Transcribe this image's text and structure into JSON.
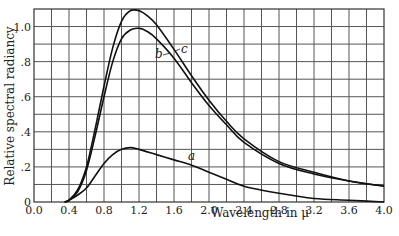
{
  "chart_data": {
    "type": "line",
    "title": "",
    "xlabel": "Wavelength in μ",
    "ylabel": "Relative spectral radiancy",
    "xlim": [
      0.0,
      4.0
    ],
    "ylim": [
      0.0,
      1.1
    ],
    "grid": true,
    "x_ticks": [
      0.0,
      0.4,
      0.8,
      1.2,
      1.6,
      2.0,
      2.4,
      2.8,
      3.2,
      3.6,
      4.0
    ],
    "x_tick_labels": [
      "0.0",
      "0.4",
      "0.8",
      "1.2",
      "1.6",
      "2.0",
      "2.4",
      "2.8",
      "3.2",
      "3.6",
      "4.0"
    ],
    "y_ticks": [
      0,
      0.2,
      0.4,
      0.6,
      0.8,
      1.0
    ],
    "y_tick_labels": [
      "0",
      ".2",
      ".4",
      ".6",
      ".8",
      "1.0"
    ],
    "legend": "none (curves labeled inline)",
    "series": [
      {
        "name": "a",
        "x": [
          0.35,
          0.4,
          0.5,
          0.6,
          0.7,
          0.8,
          0.9,
          1.0,
          1.1,
          1.2,
          1.4,
          1.6,
          1.8,
          2.0,
          2.2,
          2.4,
          2.8,
          3.2,
          3.6,
          4.0
        ],
        "values": [
          0.0,
          0.01,
          0.04,
          0.08,
          0.15,
          0.22,
          0.27,
          0.3,
          0.31,
          0.3,
          0.27,
          0.24,
          0.21,
          0.17,
          0.13,
          0.09,
          0.05,
          0.02,
          0.01,
          0.0
        ]
      },
      {
        "name": "b",
        "x": [
          0.35,
          0.4,
          0.5,
          0.6,
          0.7,
          0.8,
          0.9,
          1.0,
          1.1,
          1.2,
          1.3,
          1.4,
          1.6,
          1.8,
          2.0,
          2.2,
          2.4,
          2.8,
          3.2,
          3.6,
          4.0
        ],
        "values": [
          0.0,
          0.01,
          0.06,
          0.18,
          0.38,
          0.6,
          0.8,
          0.93,
          0.98,
          0.99,
          0.97,
          0.93,
          0.82,
          0.68,
          0.55,
          0.44,
          0.34,
          0.22,
          0.16,
          0.12,
          0.09
        ]
      },
      {
        "name": "c",
        "x": [
          0.35,
          0.4,
          0.5,
          0.6,
          0.7,
          0.8,
          0.9,
          1.0,
          1.1,
          1.2,
          1.3,
          1.4,
          1.6,
          1.8,
          2.0,
          2.2,
          2.4,
          2.8,
          3.2,
          3.6,
          4.0
        ],
        "values": [
          0.0,
          0.01,
          0.07,
          0.2,
          0.42,
          0.66,
          0.88,
          1.03,
          1.09,
          1.09,
          1.06,
          1.01,
          0.87,
          0.72,
          0.58,
          0.46,
          0.36,
          0.23,
          0.17,
          0.12,
          0.09
        ]
      }
    ],
    "annotations": [
      {
        "text": "a",
        "x": 1.8,
        "y": 0.27
      },
      {
        "text": "b",
        "x": 1.42,
        "y": 0.84
      },
      {
        "text": "c",
        "x": 1.72,
        "y": 0.86
      }
    ]
  },
  "labels": {
    "xlabel": "Wavelength in μ",
    "ylabel": "Relative spectral radiancy",
    "curve_a": "a",
    "curve_b": "b",
    "curve_c": "c"
  }
}
